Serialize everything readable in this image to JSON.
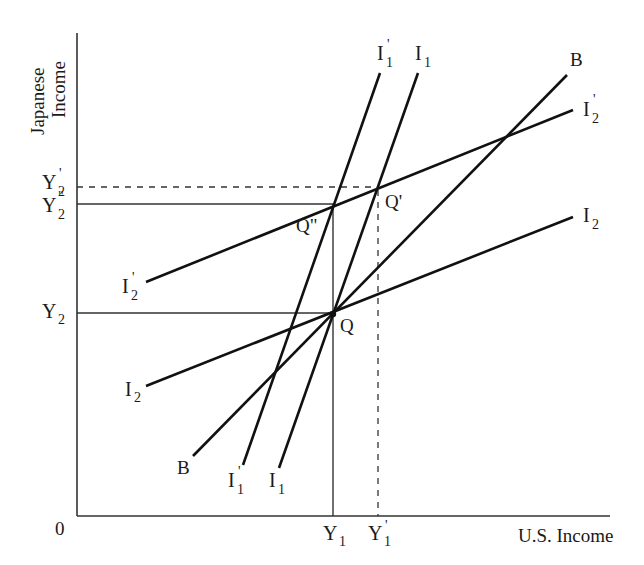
{
  "axes": {
    "y_label_line1": "Japanese",
    "y_label_line2": "Income",
    "x_label": "U.S. Income",
    "origin": "0"
  },
  "y_ticks": [
    {
      "id": "Y2prime",
      "base": "Y",
      "sub": "2",
      "sup": "'"
    },
    {
      "id": "Y2doubleprime",
      "base": "Y",
      "sub": "2",
      "sup": "\""
    },
    {
      "id": "Y2",
      "base": "Y",
      "sub": "2",
      "sup": ""
    }
  ],
  "x_ticks": [
    {
      "id": "Y1",
      "base": "Y",
      "sub": "1",
      "sup": ""
    },
    {
      "id": "Y1prime",
      "base": "Y",
      "sub": "1",
      "sup": "'"
    }
  ],
  "curves": {
    "I1": {
      "base": "I",
      "sub": "1",
      "sup": ""
    },
    "I1prime": {
      "base": "I",
      "sub": "1",
      "sup": "'"
    },
    "I2": {
      "base": "I",
      "sub": "2",
      "sup": ""
    },
    "I2prime": {
      "base": "I",
      "sub": "2",
      "sup": "'"
    },
    "B": {
      "base": "B"
    }
  },
  "points": {
    "Q": "Q",
    "Qprime": "Q'",
    "Qdoubleprime": "Q\""
  },
  "colors": {
    "line": "#111111",
    "axis": "#333333",
    "background": "#ffffff"
  }
}
